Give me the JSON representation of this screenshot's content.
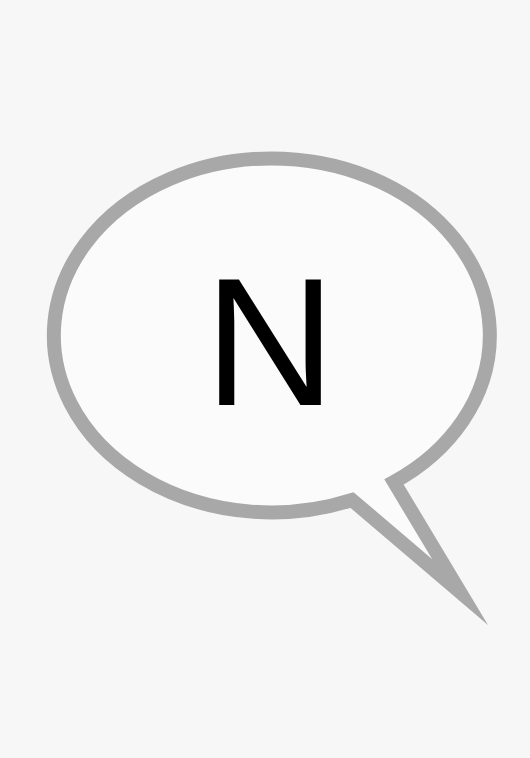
{
  "bubble": {
    "letter": "N",
    "stroke_color": "#a8a8a8",
    "fill_color": "#fbfbfb",
    "letter_color": "#000000",
    "background_color": "#f7f7f7"
  }
}
